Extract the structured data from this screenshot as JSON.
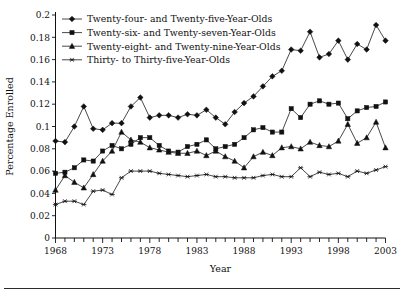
{
  "chart_data": {
    "type": "line",
    "title": "",
    "xlabel": "Year",
    "ylabel": "Percentage Enrolled",
    "xlim": [
      1968,
      2003
    ],
    "ylim": [
      0,
      0.2
    ],
    "grid": false,
    "legend_position": "top-left",
    "y_ticks": [
      0,
      0.02,
      0.04,
      0.06,
      0.08,
      0.1,
      0.12,
      0.14,
      0.16,
      0.18,
      0.2
    ],
    "y_tick_labels": [
      "0",
      "0.02",
      "0.04",
      "0.06",
      "0.08",
      "0.1",
      "0.12",
      "0.14",
      "0.16",
      "0.18",
      "0.2"
    ],
    "x_ticks": [
      1968,
      1973,
      1978,
      1983,
      1988,
      1993,
      1998,
      2003
    ],
    "x_tick_labels": [
      "1968",
      "1973",
      "1978",
      "1983",
      "1988",
      "1993",
      "1998",
      "2003"
    ],
    "x": [
      1968,
      1969,
      1970,
      1971,
      1972,
      1973,
      1974,
      1975,
      1976,
      1977,
      1978,
      1979,
      1980,
      1981,
      1982,
      1983,
      1984,
      1985,
      1986,
      1987,
      1988,
      1989,
      1990,
      1991,
      1992,
      1993,
      1994,
      1995,
      1996,
      1997,
      1998,
      1999,
      2000,
      2001,
      2002,
      2003
    ],
    "series": [
      {
        "name": "Twenty-four- and Twenty-five-Year-Olds",
        "marker": "diamond",
        "values": [
          0.087,
          0.086,
          0.1,
          0.118,
          0.098,
          0.097,
          0.103,
          0.103,
          0.118,
          0.126,
          0.108,
          0.11,
          0.11,
          0.108,
          0.111,
          0.11,
          0.115,
          0.108,
          0.102,
          0.113,
          0.121,
          0.127,
          0.136,
          0.145,
          0.15,
          0.169,
          0.168,
          0.185,
          0.162,
          0.165,
          0.177,
          0.16,
          0.174,
          0.169,
          0.191,
          0.177
        ]
      },
      {
        "name": "Twenty-six- and Twenty-seven-Year-Olds",
        "marker": "square",
        "values": [
          0.058,
          0.059,
          0.063,
          0.07,
          0.069,
          0.078,
          0.083,
          0.08,
          0.084,
          0.09,
          0.09,
          0.083,
          0.078,
          0.077,
          0.082,
          0.084,
          0.088,
          0.08,
          0.082,
          0.084,
          0.09,
          0.097,
          0.099,
          0.095,
          0.095,
          0.116,
          0.108,
          0.12,
          0.123,
          0.12,
          0.121,
          0.107,
          0.114,
          0.117,
          0.118,
          0.122
        ]
      },
      {
        "name": "Twenty-eight- and Twenty-nine-Year-Olds",
        "marker": "triangle",
        "values": [
          0.043,
          0.056,
          0.05,
          0.045,
          0.057,
          0.069,
          0.078,
          0.095,
          0.088,
          0.086,
          0.081,
          0.079,
          0.077,
          0.076,
          0.076,
          0.078,
          0.074,
          0.078,
          0.073,
          0.069,
          0.063,
          0.073,
          0.077,
          0.074,
          0.081,
          0.082,
          0.08,
          0.086,
          0.083,
          0.082,
          0.087,
          0.102,
          0.085,
          0.09,
          0.104,
          0.081
        ]
      },
      {
        "name": "Thirty- to Thirty-five-Year-Olds",
        "marker": "star",
        "values": [
          0.03,
          0.033,
          0.033,
          0.03,
          0.042,
          0.043,
          0.039,
          0.054,
          0.06,
          0.06,
          0.06,
          0.058,
          0.057,
          0.056,
          0.055,
          0.056,
          0.057,
          0.055,
          0.055,
          0.054,
          0.054,
          0.054,
          0.056,
          0.057,
          0.055,
          0.055,
          0.063,
          0.055,
          0.059,
          0.057,
          0.058,
          0.055,
          0.06,
          0.058,
          0.061,
          0.064
        ]
      }
    ]
  },
  "legend": {
    "items": [
      {
        "label": "Twenty-four- and Twenty-five-Year-Olds",
        "marker": "diamond"
      },
      {
        "label": "Twenty-six- and Twenty-seven-Year-Olds",
        "marker": "square"
      },
      {
        "label": "Twenty-eight- and Twenty-nine-Year-Olds",
        "marker": "triangle"
      },
      {
        "label": "Thirty- to Thirty-five-Year-Olds",
        "marker": "star"
      }
    ]
  },
  "colors": {
    "ink": "#111111",
    "background": "#ffffff",
    "rule": "#2b2b2b"
  }
}
